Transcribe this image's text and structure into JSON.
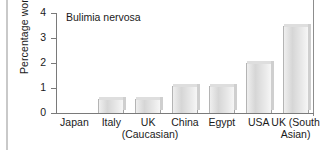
{
  "chart_data": {
    "type": "bar",
    "title": "Bulimia nervosa",
    "xlabel": "",
    "ylabel": "Percentage women",
    "categories": [
      "Japan",
      "Italy",
      "UK\n(Caucasian)",
      "China",
      "Egypt",
      "USA",
      "UK (South\nAsian)"
    ],
    "values": [
      0,
      0.55,
      0.55,
      1.1,
      1.1,
      2.0,
      3.5
    ],
    "ylim": [
      0,
      4
    ],
    "yticks": [
      0,
      1,
      2,
      3,
      4
    ],
    "ytick_labels": [
      "0",
      "1",
      "2",
      "3",
      "4"
    ],
    "grid": false,
    "legend": null,
    "bar_color": "#dcdcdc",
    "axis_color": "#7a7a7a",
    "text_color": "#1a1a1a"
  },
  "figure": {
    "title": "Bulimia nervosa",
    "y_axis_title": "Percentage women"
  }
}
